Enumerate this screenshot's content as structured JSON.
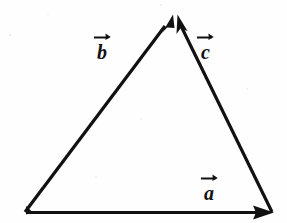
{
  "figure": {
    "background_color": "#fefefe",
    "stroke_color": "#111111",
    "stroke_width": 3,
    "width": 287,
    "height": 223
  },
  "geometry": {
    "vertices": {
      "bottom_left": {
        "x": 26,
        "y": 212
      },
      "apex": {
        "x": 175,
        "y": 14
      },
      "bottom_right": {
        "x": 272,
        "y": 212
      }
    }
  },
  "vectors": [
    {
      "id": "a",
      "label": "a",
      "has_overarrow": true,
      "from": "bottom_left",
      "to": "bottom_right",
      "direction": "right",
      "label_position": {
        "x": 204,
        "y": 181
      },
      "arrowhead_at": {
        "x": 272,
        "y": 212
      }
    },
    {
      "id": "b",
      "label": "b",
      "has_overarrow": true,
      "from": "bottom_left",
      "to": "apex",
      "direction": "up-right",
      "label_position": {
        "x": 97,
        "y": 40
      },
      "arrowhead_at": {
        "x": 171,
        "y": 17
      }
    },
    {
      "id": "c",
      "label": "c",
      "has_overarrow": true,
      "from": "bottom_right",
      "to": "apex",
      "direction": "up-left",
      "label_position": {
        "x": 201,
        "y": 40
      },
      "arrowhead_at": {
        "x": 180,
        "y": 17
      }
    }
  ],
  "labels": {
    "a": "a",
    "b": "b",
    "c": "c"
  }
}
